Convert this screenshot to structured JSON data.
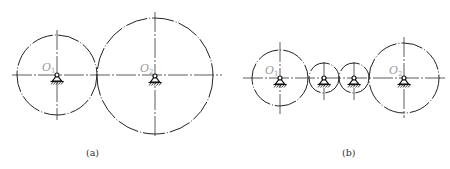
{
  "figure": {
    "panels": [
      {
        "id": "a",
        "caption": "(a)",
        "caption_pos": [
          86,
          156
        ],
        "axis_line": {
          "x1": 12,
          "x2": 222,
          "y": 75
        },
        "gears": [
          {
            "cx": 57,
            "cy": 75,
            "r": 40,
            "label": "O",
            "subscript": "1",
            "v_top": 30,
            "v_bottom": 120,
            "has_label": true
          },
          {
            "cx": 155,
            "cy": 76,
            "r": 58,
            "label": "O",
            "subscript": "2",
            "v_top": 12,
            "v_bottom": 138,
            "has_label": true
          }
        ]
      },
      {
        "id": "b",
        "caption": "(b)",
        "caption_pos": [
          342,
          156
        ],
        "axis_line": {
          "x1": 243,
          "x2": 446,
          "y": 78
        },
        "gears": [
          {
            "cx": 280,
            "cy": 78,
            "r": 28,
            "label": "O",
            "subscript": "1",
            "v_top": 42,
            "v_bottom": 115,
            "has_label": true
          },
          {
            "cx": 324,
            "cy": 78,
            "r": 15,
            "label": "",
            "subscript": "",
            "v_top": 62,
            "v_bottom": 100,
            "has_label": false
          },
          {
            "cx": 354,
            "cy": 78,
            "r": 15,
            "label": "",
            "subscript": "",
            "v_top": 62,
            "v_bottom": 100,
            "has_label": false
          },
          {
            "cx": 404,
            "cy": 78,
            "r": 35,
            "label": "O",
            "subscript": "2",
            "v_top": 37,
            "v_bottom": 118,
            "has_label": true
          }
        ]
      }
    ]
  }
}
